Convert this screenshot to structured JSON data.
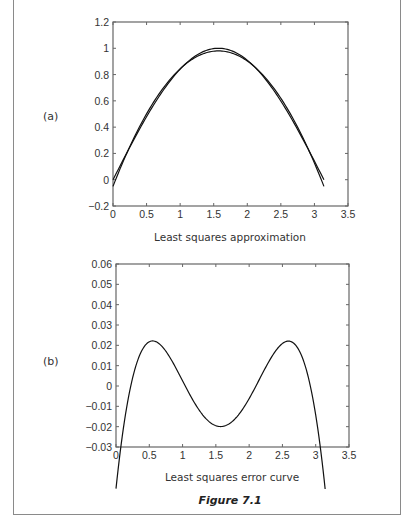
{
  "figure": {
    "caption": "Figure 7.1",
    "panels": [
      {
        "label": "(a)",
        "title": "Least squares approximation"
      },
      {
        "label": "(b)",
        "title": "Least squares error curve"
      }
    ]
  },
  "chart_data": [
    {
      "type": "line",
      "title": "Least squares approximation",
      "panel_label": "(a)",
      "xlabel": "",
      "ylabel": "",
      "xlim": [
        0,
        3.5
      ],
      "ylim": [
        -0.2,
        1.2
      ],
      "xticks": [
        0,
        0.5,
        1,
        1.5,
        2,
        2.5,
        3,
        3.5
      ],
      "yticks": [
        -0.2,
        0,
        0.2,
        0.4,
        0.6,
        0.8,
        1,
        1.2
      ],
      "xtick_labels": [
        "0",
        "0.5",
        "1",
        "1.5",
        "2",
        "2.5",
        "3",
        "3.5"
      ],
      "ytick_labels": [
        "-0.2",
        "0",
        "0.2",
        "0.4",
        "0.6",
        "0.8",
        "1",
        "1.2"
      ],
      "grid": false,
      "series": [
        {
          "name": "sin(x)",
          "x": [
            0,
            0.5,
            1.0,
            1.5708,
            2.0,
            2.5,
            3.1416
          ],
          "y": [
            0,
            0.479,
            0.841,
            1.0,
            0.909,
            0.598,
            0
          ]
        },
        {
          "name": "quadratic least squares fit",
          "x": [
            0,
            0.5,
            1.0,
            1.5708,
            2.0,
            2.5,
            3.1416
          ],
          "y": [
            -0.05,
            0.5,
            0.85,
            0.98,
            0.89,
            0.62,
            -0.05
          ]
        }
      ]
    },
    {
      "type": "line",
      "title": "Least squares error curve",
      "panel_label": "(b)",
      "xlabel": "",
      "ylabel": "",
      "xlim": [
        0,
        3.5
      ],
      "ylim": [
        -0.03,
        0.06
      ],
      "xticks": [
        0,
        0.5,
        1,
        1.5,
        2,
        2.5,
        3,
        3.5
      ],
      "yticks": [
        -0.03,
        -0.02,
        -0.01,
        0,
        0.01,
        0.02,
        0.03,
        0.04,
        0.05,
        0.06
      ],
      "xtick_labels": [
        "0",
        "0.5",
        "1",
        "1.5",
        "2",
        "2.5",
        "3",
        "3.5"
      ],
      "ytick_labels": [
        "-0.03",
        "-0.02",
        "-0.01",
        "0",
        "0.01",
        "0.02",
        "0.03",
        "0.04",
        "0.05",
        "0.06"
      ],
      "grid": false,
      "series": [
        {
          "name": "error",
          "x": [
            0,
            0.2,
            0.55,
            1.0,
            1.5708,
            2.1,
            2.6,
            2.95,
            3.1416
          ],
          "y": [
            0.05,
            0.005,
            -0.022,
            -0.005,
            0.02,
            -0.005,
            -0.023,
            0.005,
            0.049
          ]
        }
      ]
    }
  ]
}
